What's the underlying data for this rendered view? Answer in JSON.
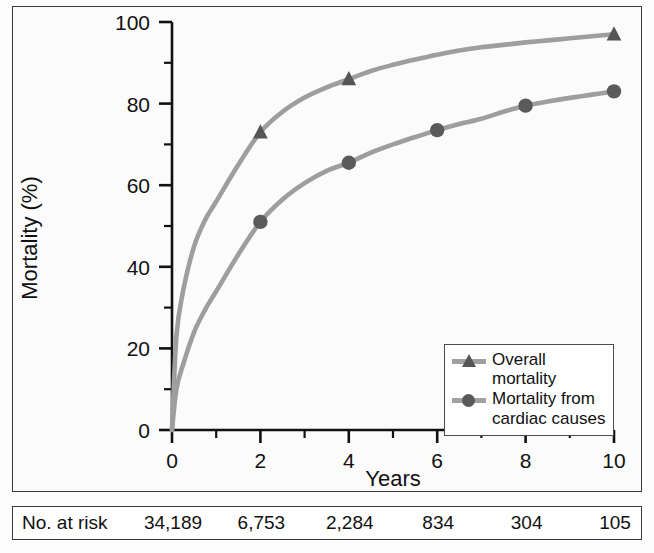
{
  "chart_data": {
    "type": "line",
    "title": "",
    "xlabel": "Years",
    "ylabel": "Mortality (%)",
    "xlim": [
      0,
      10
    ],
    "ylim": [
      0,
      100
    ],
    "xticks": [
      "0",
      "2",
      "4",
      "6",
      "8",
      "10"
    ],
    "xtick_values": [
      0,
      2,
      4,
      6,
      8,
      10
    ],
    "xminor_ticks": [
      1,
      3,
      5,
      7,
      9
    ],
    "yticks": [
      "0",
      "20",
      "40",
      "60",
      "80",
      "100"
    ],
    "ytick_values": [
      0,
      20,
      40,
      60,
      80,
      100
    ],
    "yminor_ticks": [
      10,
      30,
      50,
      70,
      90
    ],
    "grid": false,
    "legend_position": "lower right",
    "series": [
      {
        "name": "Overall mortality",
        "marker": "triangle",
        "line_color": "#9e9e9e",
        "marker_color": "#555555",
        "x": [
          0,
          0.1,
          0.25,
          0.5,
          0.75,
          1,
          1.5,
          2,
          2.5,
          3,
          3.5,
          4,
          4.5,
          5,
          5.5,
          6,
          6.5,
          7,
          7.5,
          8,
          8.5,
          9,
          9.5,
          10
        ],
        "y": [
          0,
          23,
          34,
          45,
          51.5,
          56,
          65,
          73,
          78,
          81.5,
          84,
          86,
          88,
          89.5,
          90.8,
          92,
          93,
          93.8,
          94.4,
          95,
          95.5,
          96,
          96.5,
          97
        ],
        "marker_points": [
          {
            "x": 2,
            "y": 73
          },
          {
            "x": 4,
            "y": 86
          },
          {
            "x": 10,
            "y": 97
          }
        ]
      },
      {
        "name": "Mortality from cardiac causes",
        "marker": "circle",
        "line_color": "#9e9e9e",
        "marker_color": "#5a5a5a",
        "x": [
          0,
          0.1,
          0.25,
          0.5,
          0.75,
          1,
          1.5,
          2,
          2.5,
          3,
          3.5,
          4,
          4.5,
          5,
          5.5,
          6,
          6.5,
          7,
          7.5,
          8,
          8.5,
          9,
          9.5,
          10
        ],
        "y": [
          0,
          10,
          16,
          24,
          29.5,
          34,
          43,
          51,
          56.5,
          60.5,
          63.5,
          65.5,
          68,
          70,
          71.8,
          73.5,
          75,
          76.3,
          78,
          79.5,
          80.5,
          81.4,
          82.2,
          83
        ],
        "marker_points": [
          {
            "x": 2,
            "y": 51
          },
          {
            "x": 4,
            "y": 65.5
          },
          {
            "x": 6,
            "y": 73.5
          },
          {
            "x": 8,
            "y": 79.5
          },
          {
            "x": 10,
            "y": 83
          }
        ]
      }
    ]
  },
  "legend": {
    "entries": [
      {
        "label": "Overall mortality",
        "marker": "triangle"
      },
      {
        "label": "Mortality from cardiac causes",
        "marker": "circle"
      }
    ],
    "entry1_label": "Overall mortality",
    "entry2_line1": "Mortality from",
    "entry2_line2": "cardiac causes"
  },
  "risk_table": {
    "row_label": "No. at risk",
    "values": [
      "34,189",
      "6,753",
      "2,284",
      "834",
      "304",
      "105"
    ]
  },
  "colors": {
    "line": "#9e9e9e",
    "marker_overall": "#555555",
    "marker_cardiac": "#5a5a5a",
    "axis": "#111111",
    "frame": "#3a3a3a"
  }
}
